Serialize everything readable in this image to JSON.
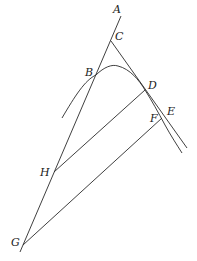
{
  "diagram": {
    "type": "geometry-figure",
    "stroke_color": "#2a2a2a",
    "points": {
      "A": {
        "label": "A",
        "x": 113,
        "y": 4
      },
      "C": {
        "label": "C",
        "x": 115,
        "y": 31
      },
      "B": {
        "label": "B",
        "x": 85,
        "y": 67
      },
      "D": {
        "label": "D",
        "x": 148,
        "y": 80
      },
      "E": {
        "label": "E",
        "x": 167,
        "y": 106
      },
      "F": {
        "label": "F",
        "x": 150,
        "y": 113
      },
      "H": {
        "label": "H",
        "x": 40,
        "y": 167
      },
      "G": {
        "label": "G",
        "x": 11,
        "y": 237
      }
    },
    "lines": [
      {
        "id": "AG",
        "from": [
          121,
          16
        ],
        "to": [
          20,
          252
        ]
      },
      {
        "id": "CE-tangent",
        "from": [
          111,
          41
        ],
        "to": [
          187,
          148
        ]
      },
      {
        "id": "HD",
        "from": [
          54,
          172
        ],
        "to": [
          145,
          90
        ]
      },
      {
        "id": "GF",
        "from": [
          23,
          245
        ],
        "to": [
          162,
          118
        ]
      }
    ],
    "curve": {
      "id": "parabola-arc",
      "path": "M62,118 C75,96 85,80 96,75 C104,67 112,64 118,66 C130,69 139,80 145,90 C152,101 158,112 165,125 C171,136 177,145 182,153"
    }
  }
}
